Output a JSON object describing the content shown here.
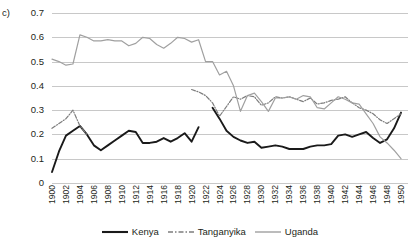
{
  "panel_label": "c)",
  "colors": {
    "kenya": "#1a1a1a",
    "tanganyika": "#7d7d7d",
    "uganda": "#a0a0a0",
    "gridline": "#c8c8c8",
    "text": "#231f20",
    "background": "#ffffff"
  },
  "legend": {
    "position": "bottom-center",
    "entries": [
      {
        "label": "Kenya",
        "icon": "solid-line-swatch"
      },
      {
        "label": "Tanganyika",
        "icon": "dash-dot-line-swatch"
      },
      {
        "label": "Uganda",
        "icon": "solid-gray-line-swatch"
      }
    ]
  },
  "chart_data": {
    "type": "line",
    "title": "",
    "subtitle": "",
    "xlabel": "",
    "ylabel": "",
    "xlim": [
      1900,
      1951
    ],
    "ylim": [
      0,
      0.7
    ],
    "grid": true,
    "y_ticks": [
      "0",
      "0.1",
      "0.2",
      "0.3",
      "0.4",
      "0.5",
      "0.6",
      "0.7"
    ],
    "y_tick_values": [
      0,
      0.1,
      0.2,
      0.3,
      0.4,
      0.5,
      0.6,
      0.7
    ],
    "x_tick_labels": [
      "1900",
      "1902",
      "1904",
      "1906",
      "1908",
      "1910",
      "1912",
      "1914",
      "1916",
      "1918",
      "1920",
      "1922",
      "1924",
      "1926",
      "1928",
      "1930",
      "1932",
      "1934",
      "1936",
      "1938",
      "1940",
      "1942",
      "1944",
      "1946",
      "1948",
      "1950"
    ],
    "x_tick_values": [
      1900,
      1902,
      1904,
      1906,
      1908,
      1910,
      1912,
      1914,
      1916,
      1918,
      1920,
      1922,
      1924,
      1926,
      1928,
      1930,
      1932,
      1934,
      1936,
      1938,
      1940,
      1942,
      1944,
      1946,
      1948,
      1950
    ],
    "x": [
      1900,
      1901,
      1902,
      1903,
      1904,
      1905,
      1906,
      1907,
      1908,
      1909,
      1910,
      1911,
      1912,
      1913,
      1914,
      1915,
      1916,
      1917,
      1918,
      1919,
      1920,
      1921,
      1922,
      1923,
      1924,
      1925,
      1926,
      1927,
      1928,
      1929,
      1930,
      1931,
      1932,
      1933,
      1934,
      1935,
      1936,
      1937,
      1938,
      1939,
      1940,
      1941,
      1942,
      1943,
      1944,
      1945,
      1946,
      1947,
      1948,
      1949,
      1950
    ],
    "series": [
      {
        "name": "Kenya",
        "style": "solid",
        "color": "#1a1a1a",
        "values": [
          0.045,
          0.13,
          0.195,
          0.215,
          0.235,
          0.2,
          0.155,
          0.135,
          0.155,
          0.175,
          0.195,
          0.215,
          0.21,
          0.165,
          0.165,
          0.17,
          0.185,
          0.17,
          0.185,
          0.205,
          0.17,
          0.23,
          null,
          0.31,
          0.265,
          0.215,
          0.19,
          0.175,
          0.165,
          0.17,
          0.145,
          0.15,
          0.155,
          0.15,
          0.14,
          0.14,
          0.14,
          0.15,
          0.155,
          0.155,
          0.16,
          0.195,
          0.2,
          0.19,
          0.2,
          0.21,
          0.185,
          0.165,
          0.18,
          0.225,
          0.29
        ]
      },
      {
        "name": "Tanganyika",
        "style": "dash-dot",
        "color": "#7d7d7d",
        "values": [
          0.225,
          0.245,
          0.265,
          0.3,
          0.235,
          0.2,
          null,
          null,
          null,
          null,
          null,
          null,
          null,
          null,
          null,
          null,
          null,
          null,
          null,
          null,
          0.385,
          0.375,
          0.36,
          0.33,
          0.275,
          0.315,
          0.355,
          0.345,
          0.36,
          0.355,
          0.32,
          0.33,
          0.355,
          0.35,
          0.355,
          0.345,
          0.335,
          0.35,
          0.325,
          0.33,
          0.34,
          0.345,
          0.355,
          0.33,
          0.31,
          0.3,
          0.285,
          0.26,
          0.245,
          0.265,
          0.285
        ]
      },
      {
        "name": "Uganda",
        "style": "solid",
        "color": "#a0a0a0",
        "values": [
          0.51,
          0.5,
          0.485,
          0.49,
          0.61,
          0.6,
          0.585,
          0.585,
          0.59,
          0.585,
          0.585,
          0.565,
          0.575,
          0.6,
          0.595,
          0.57,
          0.555,
          0.575,
          0.6,
          0.595,
          0.58,
          0.59,
          0.5,
          0.5,
          0.445,
          0.46,
          0.4,
          0.295,
          0.36,
          0.37,
          0.335,
          0.295,
          0.35,
          0.35,
          0.355,
          0.345,
          0.36,
          0.355,
          0.31,
          0.305,
          0.33,
          0.355,
          0.345,
          0.33,
          0.325,
          0.285,
          0.245,
          0.19,
          0.165,
          0.135,
          0.1
        ]
      }
    ]
  }
}
